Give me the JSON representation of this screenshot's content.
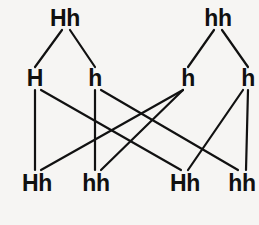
{
  "diagram": {
    "background_color": "#f6f5f3",
    "line_color": "#111111",
    "text_color": "#101010",
    "rows": {
      "parents": {
        "label": "Parent generation",
        "nodes": [
          {
            "id": "p1",
            "genotype": "Hh",
            "x": 65,
            "y": 18
          },
          {
            "id": "p2",
            "genotype": "hh",
            "x": 218,
            "y": 18
          }
        ]
      },
      "gametes": {
        "label": "Gametes",
        "nodes": [
          {
            "id": "g1",
            "genotype": "H",
            "x": 35,
            "y": 78
          },
          {
            "id": "g2",
            "genotype": "h",
            "x": 95,
            "y": 78
          },
          {
            "id": "g3",
            "genotype": "h",
            "x": 188,
            "y": 78
          },
          {
            "id": "g4",
            "genotype": "h",
            "x": 248,
            "y": 78
          }
        ]
      },
      "offspring": {
        "label": "Offspring generation",
        "nodes": [
          {
            "id": "o1",
            "genotype": "Hh",
            "x": 37,
            "y": 183
          },
          {
            "id": "o2",
            "genotype": "hh",
            "x": 96,
            "y": 183
          },
          {
            "id": "o3",
            "genotype": "Hh",
            "x": 185,
            "y": 183
          },
          {
            "id": "o4",
            "genotype": "hh",
            "x": 242,
            "y": 183
          }
        ]
      }
    },
    "edges": [
      {
        "id": "e1",
        "from": "p1",
        "to": "g1",
        "x1": 62,
        "y1": 30,
        "x2": 35,
        "y2": 67
      },
      {
        "id": "e2",
        "from": "p1",
        "to": "g2",
        "x1": 70,
        "y1": 30,
        "x2": 95,
        "y2": 67
      },
      {
        "id": "e3",
        "from": "p2",
        "to": "g3",
        "x1": 214,
        "y1": 30,
        "x2": 188,
        "y2": 67
      },
      {
        "id": "e4",
        "from": "p2",
        "to": "g4",
        "x1": 222,
        "y1": 30,
        "x2": 248,
        "y2": 67
      },
      {
        "id": "e5",
        "from": "g1",
        "to": "o1",
        "x1": 35,
        "y1": 90,
        "x2": 35,
        "y2": 170
      },
      {
        "id": "e6",
        "from": "g1",
        "to": "o3",
        "x1": 41,
        "y1": 90,
        "x2": 181,
        "y2": 170
      },
      {
        "id": "e7",
        "from": "g2",
        "to": "o2",
        "x1": 95,
        "y1": 90,
        "x2": 95,
        "y2": 170
      },
      {
        "id": "e8",
        "from": "g2",
        "to": "o4",
        "x1": 101,
        "y1": 90,
        "x2": 238,
        "y2": 170
      },
      {
        "id": "e9",
        "from": "g3",
        "to": "o1",
        "x1": 183,
        "y1": 90,
        "x2": 41,
        "y2": 170
      },
      {
        "id": "e10",
        "from": "g3",
        "to": "o2",
        "x1": 183,
        "y1": 90,
        "x2": 101,
        "y2": 170
      },
      {
        "id": "e11",
        "from": "g4",
        "to": "o3",
        "x1": 243,
        "y1": 90,
        "x2": 188,
        "y2": 170
      },
      {
        "id": "e12",
        "from": "g4",
        "to": "o4",
        "x1": 248,
        "y1": 90,
        "x2": 246,
        "y2": 170
      }
    ]
  }
}
